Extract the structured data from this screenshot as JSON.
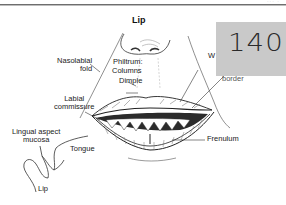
{
  "page": {
    "header_mark": "··· ·"
  },
  "diagram": {
    "title": "Lip",
    "labels": {
      "nasolabial_fold": [
        "Nasolabial",
        "fold"
      ],
      "philtrum": "Philtrum:",
      "columns": "Columns",
      "dimple": "Dimple",
      "labial_commissure": [
        "Labial",
        "commissure"
      ],
      "vermilion_partial": "W",
      "border": "border",
      "frenulum": "Frenulum",
      "lingual_aspect_mucosa": [
        "Lingual aspect",
        "mucosa"
      ],
      "tongue": "Tongue",
      "lip": "Lip"
    }
  },
  "sticky_note": {
    "text": "140",
    "color": "#c9c9c9"
  },
  "colors": {
    "line": "#333333",
    "rule": "#6e6e6e",
    "background": "#ffffff"
  }
}
